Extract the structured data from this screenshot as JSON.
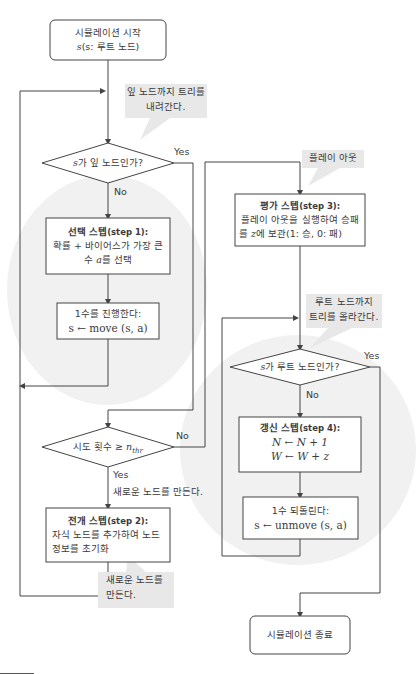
{
  "nodes": {
    "start": {
      "line1": "시뮬레이션 시작",
      "line2_var": "s",
      "line2_rest": "(s: 루트 노드)"
    },
    "leaf_check": {
      "var": "s",
      "text": "가 잎 노드인가?",
      "yes": "Yes",
      "no": "No"
    },
    "select": {
      "title": "선택 스텝",
      "title_step": "(step 1):",
      "line2": "확률 + 바이어스가 가장 큰",
      "line3_pre": "수 ",
      "line3_var": "a",
      "line3_post": "를 선택"
    },
    "move": {
      "line1": "1수를 진행한다:",
      "line2": "s ← move (s, a)"
    },
    "trials_check": {
      "text": "시도 횟수 ≥ ",
      "var": "n",
      "sub": "thr",
      "yes": "Yes",
      "no": "No",
      "yes_note": "새로운 노드를 만든다."
    },
    "expand": {
      "title": "전개 스텝",
      "title_step": "(step 2):",
      "line2": "자식 노드를 추가하여 노드",
      "line3": "정보를 초기화"
    },
    "evaluate": {
      "title": "평가 스텝",
      "title_step": "(step 3):",
      "line2": "플레이 아웃을 실행하여 승패",
      "line3_pre": "를 ",
      "line3_var": "z",
      "line3_post": "에 보관(1: 승, 0: 패)"
    },
    "root_check": {
      "var": "s",
      "text": "가 루트 노드인가?",
      "yes": "Yes",
      "no": "No"
    },
    "update": {
      "title": "갱신 스텝",
      "title_step": "(step 4):",
      "line2": "N ← N + 1",
      "line3": "W ← W + z"
    },
    "unmove": {
      "line1": "1수 되돌린다:",
      "line2": "s ← unmove (s, a)"
    },
    "end": {
      "label": "시뮬레이션 종료"
    }
  },
  "callouts": {
    "descend": {
      "line1": "잎 노드까지 트리를",
      "line2": "내려간다."
    },
    "playout": {
      "line1": "플레이 아웃"
    },
    "ascend": {
      "line1": "루트 노드까지",
      "line2": "트리를 올라간다."
    },
    "new_node": {
      "line1": "새로운 노드를",
      "line2": "만든다."
    }
  },
  "colors": {
    "line": "#444444",
    "callout_bg": "#e8e8e8",
    "ellipse_bg": "#f1f1f1"
  }
}
